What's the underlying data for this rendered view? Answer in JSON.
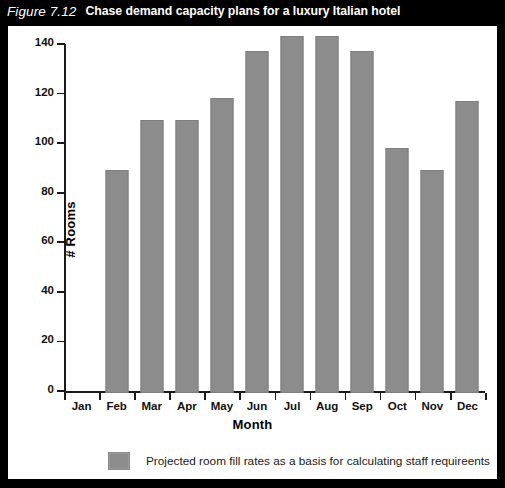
{
  "figure": {
    "number": "Figure 7.12",
    "caption": "Chase demand capacity plans for a luxury Italian hotel"
  },
  "colors": {
    "bar": "#8c8c8c",
    "frame": "#000000",
    "panel": "#ffffff",
    "text": "#000000",
    "title_text": "#ffffff"
  },
  "legend": {
    "label": "Projected room fill rates as a basis for calculating staff requireents",
    "swatch_color": "#8c8c8c",
    "position": "bottom-center"
  },
  "chart_data": {
    "type": "bar",
    "title": "Chase demand capacity plans for a luxury Italian hotel",
    "xlabel": "Month",
    "ylabel": "# Rooms",
    "categories": [
      "Jan",
      "Feb",
      "Mar",
      "Apr",
      "May",
      "Jun",
      "Jul",
      "Aug",
      "Sep",
      "Oct",
      "Nov",
      "Dec"
    ],
    "values": [
      0,
      90,
      110,
      110,
      119,
      138,
      144,
      144,
      138,
      99,
      90,
      118
    ],
    "series": [
      {
        "name": "Projected room fill rates as a basis for calculating staff requireents",
        "values": [
          0,
          90,
          110,
          110,
          119,
          138,
          144,
          144,
          138,
          99,
          90,
          118
        ]
      }
    ],
    "ylim": [
      0,
      140
    ],
    "yticks": [
      0,
      20,
      40,
      60,
      80,
      100,
      120,
      140
    ],
    "ytick_labels": [
      "0",
      "20",
      "40",
      "60",
      "80",
      "100",
      "120",
      "140"
    ],
    "grid": false,
    "legend_position": "bottom"
  }
}
